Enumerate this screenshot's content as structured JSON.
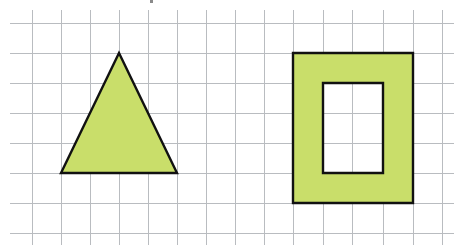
{
  "figure": {
    "background": "#ffffff",
    "fill_color": "#c9de6a",
    "stroke_color": "#111111",
    "grid_color": "#b9bcc0",
    "grid": {
      "x_lines": [
        32,
        61,
        90,
        119,
        148,
        177,
        206,
        235,
        264,
        293,
        323,
        352,
        383,
        413,
        442
      ],
      "y_lines": [
        23,
        53,
        83,
        113,
        143,
        173,
        203,
        233
      ],
      "x_extent": [
        10,
        454
      ],
      "y_extent": [
        10,
        245
      ]
    },
    "shapes": [
      {
        "name": "triangle",
        "type": "polygon",
        "points": [
          [
            119,
            53
          ],
          [
            177,
            173
          ],
          [
            61,
            173
          ]
        ],
        "description": "isosceles triangle, base 4 cells, height 4 cells"
      },
      {
        "name": "rectangular-frame",
        "type": "frame",
        "outer": {
          "x": 293,
          "y": 53,
          "w": 120,
          "h": 150
        },
        "inner": {
          "x": 323,
          "y": 83,
          "w": 60,
          "h": 90
        },
        "description": "rectangle 4x5 cells with 2x3 cell hole"
      }
    ]
  }
}
